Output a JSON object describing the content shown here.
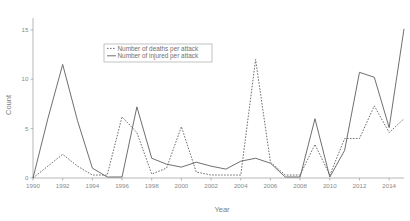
{
  "chart_data": {
    "type": "line",
    "title": "",
    "xlabel": "Year",
    "ylabel": "Count",
    "xlim": [
      1990,
      2015
    ],
    "ylim": [
      0,
      16
    ],
    "grid": false,
    "legend_position": "top-center",
    "xticks": [
      1990,
      1992,
      1994,
      1996,
      1998,
      2000,
      2002,
      2004,
      2006,
      2008,
      2010,
      2012,
      2014
    ],
    "xtick_labels": [
      "1990",
      "1992",
      "1994",
      "1996",
      "1998",
      "2000",
      "2002",
      "2004",
      "2006",
      "2008",
      "2010",
      "2012",
      "2014"
    ],
    "yticks": [
      0,
      5,
      10,
      15
    ],
    "ytick_labels": [
      "0",
      "5",
      "10",
      "15"
    ],
    "x": [
      1990,
      1991,
      1992,
      1993,
      1994,
      1995,
      1996,
      1997,
      1998,
      1999,
      2000,
      2001,
      2002,
      2003,
      2004,
      2005,
      2006,
      2007,
      2008,
      2009,
      2010,
      2011,
      2012,
      2013,
      2014,
      2015
    ],
    "series": [
      {
        "name": "Number of deaths per attack",
        "style": "dashed",
        "color": "#555555",
        "values": [
          0,
          1.2,
          2.4,
          1.2,
          0.3,
          0.3,
          6.2,
          4.6,
          0.4,
          1.0,
          5.2,
          0.6,
          0.3,
          0.3,
          0.3,
          12.0,
          1.6,
          0.3,
          0.3,
          3.4,
          0.3,
          4.0,
          4.0,
          7.3,
          4.6,
          6.0
        ]
      },
      {
        "name": "Number of injured per attack",
        "style": "solid",
        "color": "#555555",
        "values": [
          0,
          6.0,
          11.5,
          5.8,
          1.0,
          0.1,
          0.1,
          7.2,
          2.0,
          1.4,
          1.1,
          1.6,
          1.2,
          0.9,
          1.7,
          2.0,
          1.5,
          0.1,
          0.1,
          6.0,
          0.1,
          2.8,
          10.7,
          10.2,
          5.1,
          15.1
        ]
      }
    ]
  },
  "legend": {
    "entries": [
      {
        "label": "Number of deaths per attack",
        "style": "dashed"
      },
      {
        "label": "Number of injured per attack",
        "style": "solid"
      }
    ]
  },
  "axes": {
    "x_title": "Year",
    "y_title": "Count"
  }
}
